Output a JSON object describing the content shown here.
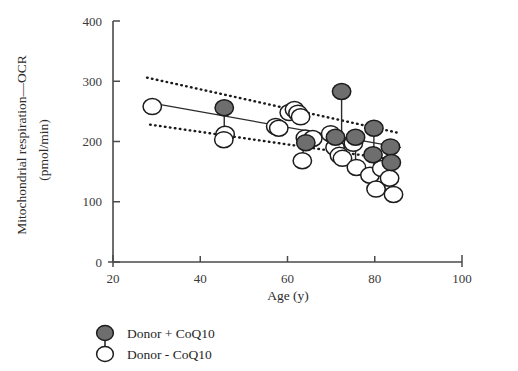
{
  "chart_data": {
    "type": "scatter",
    "title": "",
    "xlabel": "Age (y)",
    "ylabel": "Mitochondrial respiration—OCR",
    "ylabel_units": "(pmol/min)",
    "xlim": [
      20,
      100
    ],
    "ylim": [
      0,
      400
    ],
    "xticks": [
      20,
      40,
      60,
      80,
      100
    ],
    "yticks": [
      0,
      100,
      200,
      300,
      400
    ],
    "xtick_labels": [
      "20",
      "40",
      "60",
      "80",
      "100"
    ],
    "ytick_labels": [
      "0",
      "100",
      "200",
      "300",
      "400"
    ],
    "grid": false,
    "legend_position": "below-left",
    "colors": {
      "filled_marker": "#6e6e6e",
      "marker_stroke": "#1c1c1c",
      "open_marker": "#ffffff",
      "axis": "#4a4a4a",
      "fit_line": "#2b2b2b",
      "ci_line": "#1a1a1a"
    },
    "series": [
      {
        "name": "Donor + CoQ10",
        "marker": "filled-circle",
        "points": [
          {
            "x": 45.5,
            "y": 256
          },
          {
            "x": 72.4,
            "y": 283
          },
          {
            "x": 64.2,
            "y": 198
          },
          {
            "x": 71.0,
            "y": 207
          },
          {
            "x": 75.6,
            "y": 207
          },
          {
            "x": 79.8,
            "y": 222
          },
          {
            "x": 83.6,
            "y": 191
          },
          {
            "x": 83.8,
            "y": 165
          },
          {
            "x": 79.6,
            "y": 178
          }
        ]
      },
      {
        "name": "Donor - CoQ10",
        "marker": "open-circle",
        "points": [
          {
            "x": 29.0,
            "y": 258
          },
          {
            "x": 45.7,
            "y": 212
          },
          {
            "x": 45.4,
            "y": 203
          },
          {
            "x": 57.3,
            "y": 225
          },
          {
            "x": 58.0,
            "y": 222
          },
          {
            "x": 60.4,
            "y": 248
          },
          {
            "x": 61.6,
            "y": 253
          },
          {
            "x": 62.4,
            "y": 247
          },
          {
            "x": 63.0,
            "y": 241
          },
          {
            "x": 63.4,
            "y": 168
          },
          {
            "x": 64.1,
            "y": 206
          },
          {
            "x": 65.8,
            "y": 205
          },
          {
            "x": 69.9,
            "y": 213
          },
          {
            "x": 70.9,
            "y": 190
          },
          {
            "x": 71.9,
            "y": 177
          },
          {
            "x": 72.6,
            "y": 172
          },
          {
            "x": 75.1,
            "y": 197
          },
          {
            "x": 75.8,
            "y": 157
          },
          {
            "x": 78.9,
            "y": 144
          },
          {
            "x": 80.3,
            "y": 121
          },
          {
            "x": 81.6,
            "y": 155
          },
          {
            "x": 83.4,
            "y": 139
          },
          {
            "x": 84.3,
            "y": 112
          }
        ]
      }
    ],
    "pair_connectors": [
      {
        "x": 45.5,
        "y_top": 256,
        "y_bottom": 205
      },
      {
        "x": 72.4,
        "y_top": 283,
        "y_bottom": 207
      },
      {
        "x": 71.0,
        "y_top": 207,
        "y_bottom": 177
      },
      {
        "x": 75.6,
        "y_top": 207,
        "y_bottom": 157
      },
      {
        "x": 79.8,
        "y_top": 222,
        "y_bottom": 144
      },
      {
        "x": 83.6,
        "y_top": 191,
        "y_bottom": 139
      },
      {
        "x": 63.6,
        "y_top": 205,
        "y_bottom": 168
      },
      {
        "x": 84.0,
        "y_top": 165,
        "y_bottom": 112
      }
    ],
    "fit_line": {
      "style": "solid",
      "x0": 28.0,
      "y0": 265,
      "x1": 86.0,
      "y1": 190
    },
    "ci_upper": {
      "style": "dotted",
      "x0": 27.8,
      "y0": 306,
      "x1": 85.0,
      "y1": 215
    },
    "ci_lower": {
      "style": "dotted",
      "x0": 28.5,
      "y0": 228,
      "x1": 86.0,
      "y1": 168
    }
  },
  "legend": {
    "items": [
      {
        "label": "Donor + CoQ10",
        "marker": "filled-circle"
      },
      {
        "label": "Donor - CoQ10",
        "marker": "open-circle"
      }
    ]
  }
}
